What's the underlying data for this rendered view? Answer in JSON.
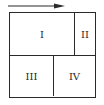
{
  "diagram": {
    "arrow": {
      "direction": "right",
      "color": "#2a2a2a"
    },
    "regions": [
      {
        "label": "I"
      },
      {
        "label": "II"
      },
      {
        "label": "III"
      },
      {
        "label": "IV"
      }
    ],
    "line_color": "#2a2a2a"
  }
}
